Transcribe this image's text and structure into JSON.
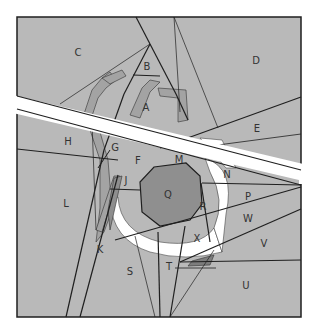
{
  "diagram": {
    "type": "foundation-paper-piecing-pattern",
    "colors": {
      "background": "#ffffff",
      "fill_light": "#b9b9b9",
      "fill_mid": "#a3a3a3",
      "fill_dark": "#8a8a8a",
      "fill_center": "#8f8f8f",
      "fill_white": "#ffffff",
      "stroke": "#1f1f1f"
    },
    "regions": [
      {
        "id": "A",
        "label": "A",
        "x": 146,
        "y": 107
      },
      {
        "id": "B",
        "label": "B",
        "x": 147,
        "y": 66
      },
      {
        "id": "C",
        "label": "C",
        "x": 78,
        "y": 52
      },
      {
        "id": "D",
        "label": "D",
        "x": 256,
        "y": 60
      },
      {
        "id": "E",
        "label": "E",
        "x": 257,
        "y": 128
      },
      {
        "id": "F",
        "label": "F",
        "x": 138,
        "y": 160
      },
      {
        "id": "G",
        "label": "G",
        "x": 115,
        "y": 147
      },
      {
        "id": "H",
        "label": "H",
        "x": 68,
        "y": 141
      },
      {
        "id": "J",
        "label": "J",
        "x": 126,
        "y": 180
      },
      {
        "id": "K",
        "label": "K",
        "x": 100,
        "y": 249
      },
      {
        "id": "L",
        "label": "L",
        "x": 66,
        "y": 203
      },
      {
        "id": "M",
        "label": "M",
        "x": 179,
        "y": 159
      },
      {
        "id": "N",
        "label": "N",
        "x": 227,
        "y": 174
      },
      {
        "id": "P",
        "label": "P",
        "x": 248,
        "y": 196
      },
      {
        "id": "Q",
        "label": "Q",
        "x": 168,
        "y": 194
      },
      {
        "id": "R",
        "label": "R",
        "x": 203,
        "y": 206
      },
      {
        "id": "S",
        "label": "S",
        "x": 130,
        "y": 271
      },
      {
        "id": "T",
        "label": "T",
        "x": 169,
        "y": 266
      },
      {
        "id": "U",
        "label": "U",
        "x": 246,
        "y": 285
      },
      {
        "id": "V",
        "label": "V",
        "x": 264,
        "y": 243
      },
      {
        "id": "W",
        "label": "W",
        "x": 248,
        "y": 218
      },
      {
        "id": "X",
        "label": "X",
        "x": 197,
        "y": 238
      }
    ]
  }
}
